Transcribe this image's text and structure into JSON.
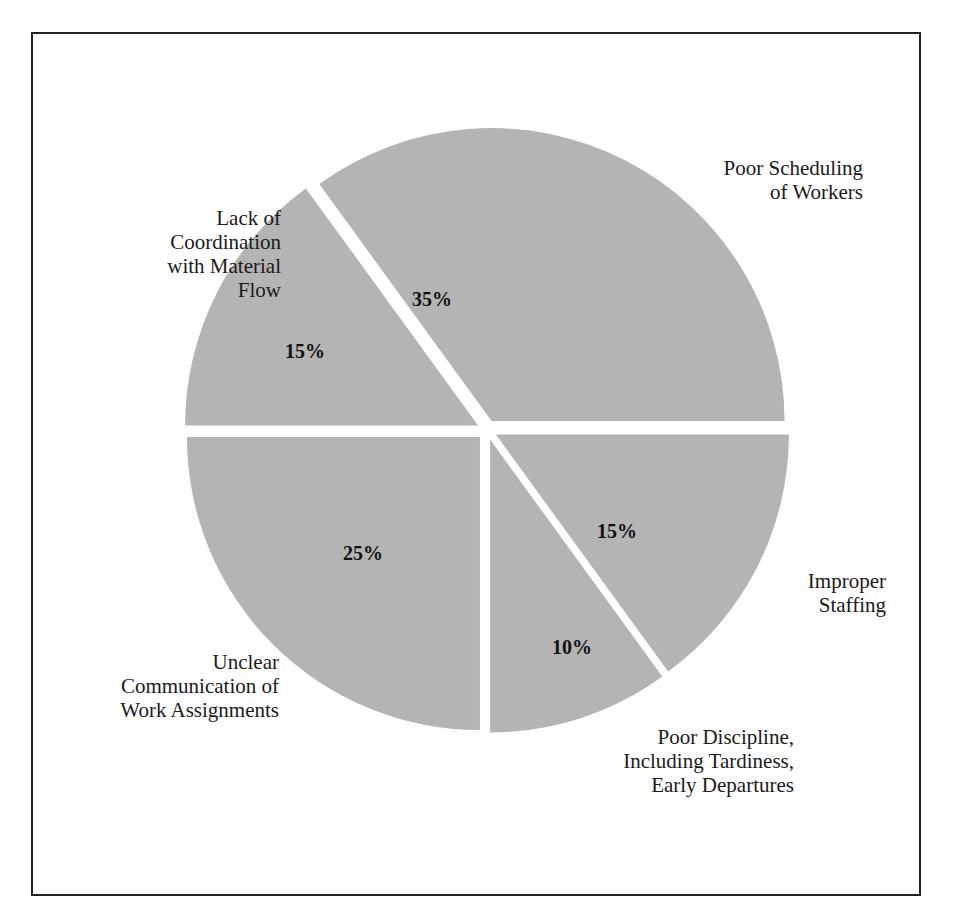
{
  "chart_data": {
    "type": "pie",
    "title": "",
    "exploded": true,
    "slice_color": "#b4b4b4",
    "slices": [
      {
        "label": "Poor Scheduling of Workers",
        "value": 35,
        "display": "35%"
      },
      {
        "label": "Improper Staffing",
        "value": 15,
        "display": "15%"
      },
      {
        "label": "Poor Discipline, Including Tardiness, Early Departures",
        "value": 10,
        "display": "10%"
      },
      {
        "label": "Unclear Communication of Work Assignments",
        "value": 25,
        "display": "25%"
      },
      {
        "label": "Lack of Coordination with Material Flow",
        "value": 15,
        "display": "15%"
      }
    ]
  },
  "labels": {
    "scheduling": "Poor Scheduling\nof Workers",
    "staffing": "Improper\nStaffing",
    "discipline": "Poor Discipline,\nIncluding Tardiness,\nEarly Departures",
    "communication": "Unclear\nCommunication of\nWork Assignments",
    "coordination": "Lack of\nCoordination\nwith Material\nFlow"
  },
  "percents": {
    "scheduling": "35%",
    "staffing": "15%",
    "discipline": "10%",
    "communication": "25%",
    "coordination": "15%"
  }
}
